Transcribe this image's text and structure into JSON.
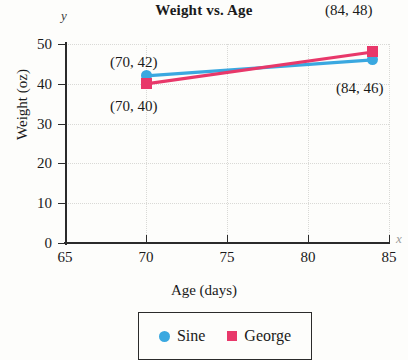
{
  "chart_data": {
    "type": "line",
    "title": "Weight vs. Age",
    "xlabel": "Age (days)",
    "ylabel": "Weight (oz)",
    "x_axis_symbol": "x",
    "y_axis_symbol": "y",
    "xlim": [
      65,
      85
    ],
    "ylim": [
      0,
      50
    ],
    "xticks": [
      65,
      70,
      75,
      80,
      85
    ],
    "yticks": [
      0,
      10,
      20,
      30,
      40,
      50
    ],
    "grid": true,
    "legend_position": "bottom",
    "series": [
      {
        "name": "Sine",
        "color": "#3aa8e0",
        "marker": "circle",
        "x": [
          70,
          84
        ],
        "values": [
          42,
          46
        ],
        "point_labels": [
          "(70, 42)",
          "(84, 46)"
        ]
      },
      {
        "name": "George",
        "color": "#e8386a",
        "marker": "square",
        "x": [
          70,
          84
        ],
        "values": [
          40,
          48
        ],
        "point_labels": [
          "(70, 40)",
          "(84, 48)"
        ]
      }
    ],
    "annotations": [
      {
        "text": "(70, 42)",
        "left": 110,
        "top": 54
      },
      {
        "text": "(70, 40)",
        "left": 110,
        "top": 98
      },
      {
        "text": "(84, 48)",
        "left": 325,
        "top": 2
      },
      {
        "text": "(84, 46)",
        "left": 336,
        "top": 80
      }
    ]
  },
  "legend": {
    "entries": [
      {
        "label": "Sine",
        "color": "#3aa8e0",
        "marker": "circle"
      },
      {
        "label": "George",
        "color": "#e8386a",
        "marker": "square"
      }
    ]
  }
}
